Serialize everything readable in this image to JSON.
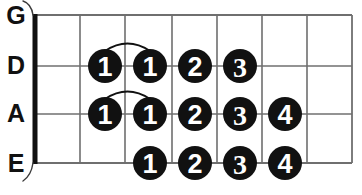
{
  "diagram": {
    "type": "guitar-fretboard-chart",
    "instrument": "guitar",
    "orientation": "horizontal",
    "nut_shown": true,
    "fret_count": 7,
    "string_labels": [
      "G",
      "A",
      "D",
      "E"
    ],
    "strings": [
      {
        "id": "string-g",
        "label": "G",
        "y": 15,
        "notes": []
      },
      {
        "id": "string-d",
        "label": "D",
        "y": 66,
        "notes": [
          {
            "finger": "1",
            "cx": 105,
            "fret": 1
          },
          {
            "finger": "1",
            "cx": 150,
            "fret": 2
          },
          {
            "finger": "2",
            "cx": 195,
            "fret": 3
          },
          {
            "finger": "3",
            "cx": 240,
            "fret": 4
          }
        ]
      },
      {
        "id": "string-a",
        "label": "A",
        "y": 114,
        "notes": [
          {
            "finger": "1",
            "cx": 105,
            "fret": 1
          },
          {
            "finger": "1",
            "cx": 150,
            "fret": 2
          },
          {
            "finger": "2",
            "cx": 195,
            "fret": 3
          },
          {
            "finger": "3",
            "cx": 240,
            "fret": 4
          },
          {
            "finger": "4",
            "cx": 285,
            "fret": 5
          }
        ]
      },
      {
        "id": "string-e",
        "label": "E",
        "y": 163,
        "notes": [
          {
            "finger": "1",
            "cx": 150,
            "fret": 2
          },
          {
            "finger": "2",
            "cx": 195,
            "fret": 3
          },
          {
            "finger": "3",
            "cx": 240,
            "fret": 4
          },
          {
            "finger": "4",
            "cx": 285,
            "fret": 5
          }
        ]
      }
    ],
    "slide_arcs": [
      {
        "from_cx": 105,
        "to_cx": 150,
        "y": 66
      },
      {
        "from_cx": 105,
        "to_cx": 150,
        "y": 114
      }
    ],
    "geometry": {
      "nut_x": 35,
      "board_right_x": 352,
      "board_top_y": 15,
      "board_bottom_y": 163,
      "fret_x": [
        80,
        125,
        172,
        217,
        262,
        307
      ],
      "circle_radius": 17
    },
    "colors": {
      "ink": "#111111",
      "grid": "#6f6f6f",
      "background": "#ffffff",
      "number": "#ffffff"
    },
    "labels": {
      "g": "G",
      "d": "D",
      "a": "A",
      "e": "E",
      "one": "1",
      "two": "2",
      "three": "3",
      "four": "4"
    }
  }
}
